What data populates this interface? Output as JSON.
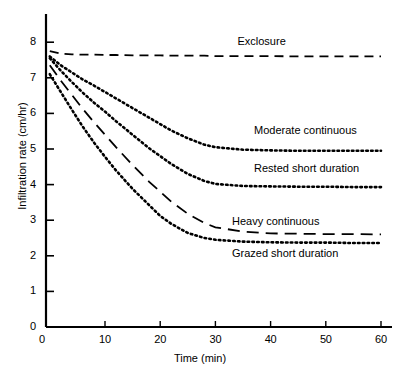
{
  "chart_data": {
    "type": "line",
    "title": "",
    "xlabel": "Time (min)",
    "ylabel": "Infiltration rate (cm/hr)",
    "xlim": [
      0,
      62
    ],
    "ylim": [
      0,
      8.3
    ],
    "xticks": [
      0,
      10,
      20,
      30,
      40,
      50,
      60
    ],
    "yticks": [
      0,
      1,
      2,
      3,
      4,
      5,
      6,
      7,
      8
    ],
    "grid": false,
    "legend_position": "inline-right-of-curves",
    "x": [
      0,
      2,
      4,
      6,
      8,
      10,
      12,
      15,
      18,
      20,
      22,
      25,
      28,
      30,
      35,
      40,
      45,
      50,
      55,
      60
    ],
    "series": [
      {
        "name": "Exclosure",
        "linestyle": "dashed",
        "label_x": 34,
        "label_y": 8.0,
        "values": [
          7.75,
          7.68,
          7.66,
          7.65,
          7.65,
          7.64,
          7.64,
          7.63,
          7.63,
          7.63,
          7.62,
          7.62,
          7.62,
          7.61,
          7.61,
          7.61,
          7.6,
          7.6,
          7.6,
          7.6
        ]
      },
      {
        "name": "Moderate continuous",
        "linestyle": "dotted",
        "label_x": 37,
        "label_y": 5.5,
        "values": [
          7.6,
          7.35,
          7.15,
          6.95,
          6.78,
          6.6,
          6.42,
          6.15,
          5.88,
          5.7,
          5.52,
          5.3,
          5.12,
          5.05,
          4.98,
          4.96,
          4.95,
          4.95,
          4.95,
          4.95
        ]
      },
      {
        "name": "Rested short duration",
        "linestyle": "dotted",
        "label_x": 37,
        "label_y": 4.45,
        "values": [
          7.55,
          7.2,
          6.88,
          6.58,
          6.3,
          6.05,
          5.78,
          5.4,
          5.02,
          4.8,
          4.58,
          4.3,
          4.1,
          4.02,
          3.96,
          3.95,
          3.94,
          3.94,
          3.93,
          3.93
        ]
      },
      {
        "name": "Heavy continuous",
        "linestyle": "long-dashed",
        "label_x": 33,
        "label_y": 2.95,
        "values": [
          7.35,
          6.92,
          6.52,
          6.12,
          5.75,
          5.4,
          5.05,
          4.55,
          4.08,
          3.8,
          3.52,
          3.18,
          2.92,
          2.8,
          2.68,
          2.63,
          2.62,
          2.61,
          2.61,
          2.6
        ]
      },
      {
        "name": "Grazed short duration",
        "linestyle": "dotted",
        "label_x": 33,
        "label_y": 2.05,
        "values": [
          7.1,
          6.6,
          6.1,
          5.62,
          5.18,
          4.78,
          4.4,
          3.88,
          3.42,
          3.12,
          2.9,
          2.64,
          2.5,
          2.45,
          2.4,
          2.38,
          2.37,
          2.37,
          2.36,
          2.36
        ]
      }
    ]
  },
  "axis": {
    "x_title": "Time (min)",
    "y_title": "Infiltration rate (cm/hr)",
    "x_tick_labels": [
      "0",
      "10",
      "20",
      "30",
      "40",
      "50",
      "60"
    ],
    "y_tick_labels": [
      "0",
      "1",
      "2",
      "3",
      "4",
      "5",
      "6",
      "7",
      "8"
    ]
  },
  "labels": {
    "exclosure": "Exclosure",
    "moderate_continuous": "Moderate continuous",
    "rested_short_duration": "Rested short duration",
    "heavy_continuous": "Heavy continuous",
    "grazed_short_duration": "Grazed short duration"
  },
  "colors": {
    "ink": "#000000",
    "background": "#ffffff"
  }
}
